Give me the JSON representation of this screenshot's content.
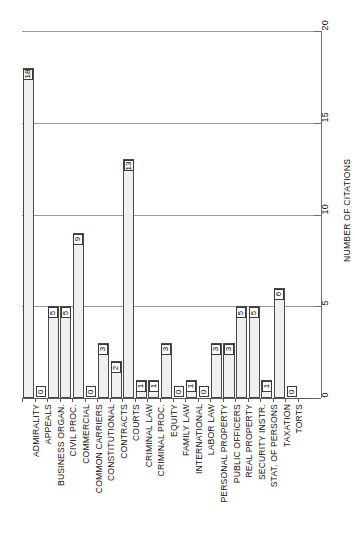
{
  "chart_data": {
    "type": "bar",
    "title": "",
    "subtitle": "",
    "xlabel": "",
    "ylabel": "NUMBER OF CITATIONS",
    "ylim": [
      0,
      20
    ],
    "ytick_labels": [
      "0",
      "5",
      "10",
      "15",
      "20"
    ],
    "ytick_values": [
      0,
      5,
      10,
      15,
      20
    ],
    "grid": true,
    "grid_axis": "value",
    "legend": false,
    "legend_position": "none",
    "orientation": "vertical-bars-rotated-90",
    "bar_fill": "#f0f0f0",
    "bar_fill_pattern": "fine-crosshatch-grid",
    "bar_edge": "#4a4a4a",
    "value_labels_shown": true,
    "categories": [
      "ADMIRALITY",
      "APPEALS",
      "BUSINESS ORGAN.",
      "CIVIL PROC.",
      "COMMERCIAL",
      "COMMON CARRIERS",
      "CONSTITUTIONAL",
      "CONTRACTS",
      "COURTS",
      "CRIMINAL LAW",
      "CRIMINAL PROC.",
      "EQUITY",
      "FAMILY LAW",
      "INTERNATIONAL",
      "LABOR LAW",
      "PERSONAL PROPERTY",
      "PUBLIC OFFICERS",
      "REAL PROPERTY",
      "SECURITY INSTR.",
      "STAT. OF PERSONS",
      "TAXATION",
      "TORTS"
    ],
    "values": [
      18,
      0,
      5,
      5,
      9,
      0,
      3,
      2,
      13,
      1,
      1,
      3,
      0,
      1,
      0,
      3,
      3,
      5,
      5,
      1,
      6,
      0
    ],
    "value_label_texts": [
      "18",
      "0",
      "5",
      "5",
      "9",
      "0",
      "3",
      "2",
      "13",
      "1",
      "1",
      "3",
      "0",
      "1",
      "0",
      "3",
      "3",
      "5",
      "5",
      "1",
      "6",
      "0"
    ]
  }
}
